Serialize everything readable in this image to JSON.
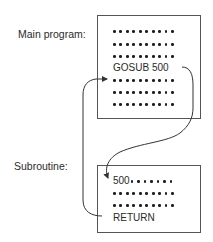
{
  "labels": {
    "main": "Main program:",
    "subroutine": "Subroutine:"
  },
  "main_program": {
    "lines": [
      {
        "type": "dots",
        "count": 10
      },
      {
        "type": "dots",
        "count": 10
      },
      {
        "type": "dots",
        "count": 10
      },
      {
        "type": "text",
        "text": "GOSUB 500"
      },
      {
        "type": "dots",
        "count": 10
      },
      {
        "type": "dots",
        "count": 10
      },
      {
        "type": "dots",
        "count": 10
      }
    ],
    "gosub_text": "GOSUB 500"
  },
  "subroutine": {
    "lines": [
      {
        "type": "text+dots",
        "text": "500",
        "count": 7
      },
      {
        "type": "dots",
        "count": 10
      },
      {
        "type": "dots",
        "count": 10
      },
      {
        "type": "text",
        "text": "RETURN"
      }
    ],
    "start_text": "500",
    "return_text": "RETURN"
  },
  "arrows": [
    {
      "name": "gosub-arrow",
      "from": "GOSUB 500",
      "to": "500"
    },
    {
      "name": "return-arrow",
      "from": "RETURN",
      "to": "line after GOSUB 500"
    }
  ],
  "colors": {
    "ink": "#1f1f1f",
    "border": "#555555",
    "background": "#ffffff"
  }
}
